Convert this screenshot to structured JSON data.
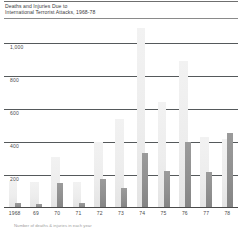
{
  "chart_data": {
    "type": "bar",
    "title": "Deaths and Injuries Due to\nInternational Terrorist Attacks,  1968-78",
    "title_line1": "Deaths and Injuries Due to",
    "title_line2": "International Terrorist Attacks,  1968-78",
    "xlabel": "",
    "ylabel": "",
    "ylim": [
      0,
      1100
    ],
    "yticks": [
      200,
      400,
      600,
      800,
      1000
    ],
    "ytick_labels": [
      "200",
      "400",
      "600",
      "800",
      "1,000"
    ],
    "grid": true,
    "legend": "none",
    "categories": [
      "1968",
      "69",
      "70",
      "71",
      "72",
      "73",
      "74",
      "75",
      "76",
      "77",
      "78"
    ],
    "series": [
      {
        "name": "Injuries",
        "color": "#ededed",
        "values": [
          165,
          155,
          310,
          155,
          400,
          540,
          1090,
          640,
          890,
          430,
          415
        ]
      },
      {
        "name": "Deaths",
        "color": "#8f8f8f",
        "values": [
          30,
          25,
          150,
          30,
          175,
          120,
          330,
          225,
          400,
          215,
          455
        ]
      }
    ],
    "footnote": "Number of deaths & injuries in each year"
  },
  "colors": {
    "gridline": "#55595b",
    "axis": "#4a4a4a",
    "rule": "#6f6f6f",
    "back_bar": "#ededed",
    "front_bar": "#8f8f8f",
    "text": "#3c3c3c",
    "footnote_text": "#9d9d9d"
  }
}
